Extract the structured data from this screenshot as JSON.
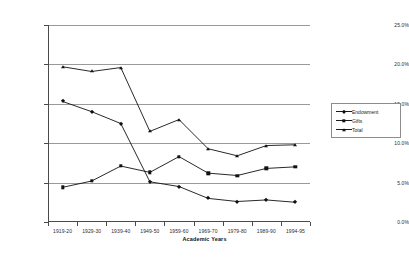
{
  "chart_data": {
    "type": "line",
    "title": "",
    "xlabel": "Academic Years",
    "ylabel": "",
    "categories": [
      "1919-20",
      "1929-30",
      "1939-40",
      "1949-50",
      "1959-60",
      "1969-70",
      "1979-80",
      "1989-90",
      "1994-95"
    ],
    "ylim": [
      0,
      25
    ],
    "ytick_labels": [
      "0.0%",
      "5.0%",
      "10.0%",
      "15.0%",
      "20.0%",
      "25.0%"
    ],
    "ytick_values": [
      0,
      5,
      10,
      15,
      20,
      25
    ],
    "grid": true,
    "legend_position": "right",
    "series": [
      {
        "name": "Endowment",
        "marker": "diamond",
        "values": [
          15.3,
          14.0,
          12.5,
          5.1,
          4.5,
          3.0,
          2.6,
          2.8,
          2.5
        ]
      },
      {
        "name": "Gifts",
        "marker": "square",
        "values": [
          4.4,
          5.2,
          7.1,
          6.3,
          8.3,
          6.2,
          5.9,
          6.8,
          7.0
        ]
      },
      {
        "name": "Total",
        "marker": "triangle",
        "values": [
          19.7,
          19.1,
          19.6,
          11.5,
          13.0,
          9.3,
          8.4,
          9.7,
          9.8
        ]
      }
    ],
    "colors": {
      "line": "#111111",
      "grid": "#9a9a9a",
      "axis": "#4a4a4a",
      "background": "#ffffff"
    }
  },
  "legend": {
    "items": [
      {
        "label": "Endowment"
      },
      {
        "label": "Gifts"
      },
      {
        "label": "Total"
      }
    ]
  }
}
